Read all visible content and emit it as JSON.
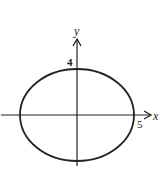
{
  "diagram": {
    "type": "ellipse-graph",
    "equation_hint": "x^2/25 + y^2/16 = 1",
    "x_axis_label": "x",
    "y_axis_label": "y",
    "x_intercept_label": "5",
    "y_intercept_label": "4",
    "semi_major_axis": 5,
    "semi_minor_axis": 4,
    "center": [
      0,
      0
    ],
    "stroke_color": "#222222"
  }
}
